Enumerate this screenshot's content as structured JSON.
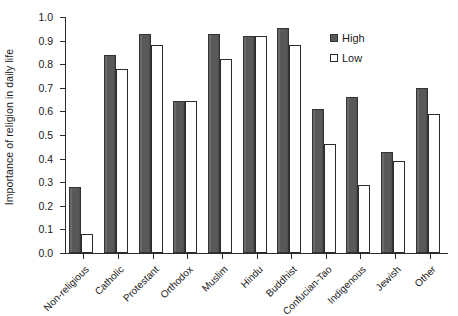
{
  "chart_data": {
    "type": "bar",
    "title": "",
    "subtitle": "",
    "xlabel": "",
    "ylabel": "Importance of religion in daily life",
    "ylim": [
      0.0,
      1.0
    ],
    "ytick_labels": [
      "0.0",
      "0.1",
      "0.2",
      "0.3",
      "0.4",
      "0.5",
      "0.6",
      "0.7",
      "0.8",
      "0.9",
      "1.0"
    ],
    "ytick_values": [
      0.0,
      0.1,
      0.2,
      0.3,
      0.4,
      0.5,
      0.6,
      0.7,
      0.8,
      0.9,
      1.0
    ],
    "grid": false,
    "legend_position": "inside-top-right",
    "categories": [
      "Non-religious",
      "Catholic",
      "Protestant",
      "Orthodox",
      "Muslim",
      "Hindu",
      "Buddhist",
      "Confucian-Tao",
      "Indigenous",
      "Jewish",
      "Other"
    ],
    "series": [
      {
        "name": "High",
        "color": "#595959",
        "values": [
          0.28,
          0.84,
          0.93,
          0.645,
          0.93,
          0.92,
          0.955,
          0.61,
          0.66,
          0.43,
          0.7
        ]
      },
      {
        "name": "Low",
        "color": "#ffffff",
        "values": [
          0.08,
          0.78,
          0.88,
          0.645,
          0.82,
          0.92,
          0.88,
          0.46,
          0.29,
          0.39,
          0.59
        ]
      }
    ]
  },
  "legend": {
    "items": [
      {
        "label": "High",
        "swatch": "filled-dark-square"
      },
      {
        "label": "Low",
        "swatch": "open-white-square"
      }
    ]
  },
  "colors": {
    "high_fill": "#595959",
    "low_fill": "#ffffff",
    "axis": "#2b2b2b",
    "text": "#1a1a1a",
    "background": "#ffffff"
  }
}
